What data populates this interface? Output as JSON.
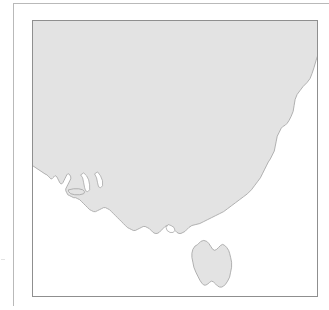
{
  "figure": {
    "type": "map",
    "title": "",
    "caption": "",
    "region_depicted": "south-eastern Australia",
    "projection_note": "",
    "panel": {
      "border_color": "#8f8f8f",
      "background_color": "#ffffff"
    },
    "frame": {
      "rule_color": "#b9b9b9",
      "tick_color": "#e2e2e2"
    }
  },
  "map": {
    "land_fill_color": "#e3e3e3",
    "land_stroke_color": "#a8a8a8",
    "sea_fill_color": "#ffffff",
    "features": [
      {
        "name": "australian-mainland",
        "label": "",
        "fill": "#e3e3e3",
        "path": "M -4 -4 L 292 -4 L 292 22 L 288 31 L 285 40 L 283 47 L 281 53 L 279 58 L 276 62 L 272 66 L 269 70 L 266 74 L 264 79 L 263 85 L 262 91 L 260 96 L 258 100 L 256 103 L 254 105 L 252 106 L 250 108 L 248 112 L 246 116 L 245 121 L 244 126 L 243 131 L 241 135 L 239 139 L 237 142 L 235 146 L 233 150 L 231 154 L 229 158 L 226 162 L 223 166 L 220 170 L 216 174 L 212 177 L 208 180 L 204 183 L 200 186 L 196 189 L 192 192 L 188 194 L 184 196 L 180 198 L 176 200 L 172 202 L 168 204 L 164 205 L 160 206 L 157 208 L 155 210 L 153 212 L 151 213 L 149 214 L 147 214 L 145 213 L 143 211 L 141 209 L 139 207 L 137 206 L 135 206 L 133 207 L 131 209 L 129 211 L 127 213 L 125 214 L 123 214 L 121 213 L 119 211 L 117 209 L 115 208 L 113 207 L 111 207 L 109 208 L 107 209 L 105 210 L 103 211 L 101 211 L 99 210 L 97 209 L 95 208 L 93 206 L 91 204 L 89 202 L 87 200 L 85 198 L 83 196 L 81 194 L 79 192 L 77 190 L 75 189 L 73 188 L 71 188 L 69 189 L 67 190 L 65 191 L 63 192 L 61 192 L 59 191 L 57 190 L 55 188 L 53 186 L 51 184 L 49 182 L 47 180 L 45 179 L 43 178 L 41 178 L 39 177 L 37 176 L 35 175 L 34 173 L 33 171 L 33 169 L 34 167 L 35 165 L 36 163 L 37 161 L 38 159 L 38 157 L 37 155 L 36 154 L 35 154 L 34 155 L 33 157 L 32 159 L 31 161 L 30 163 L 29 164 L 28 164 L 27 163 L 26 161 L 25 159 L 24 157 L 23 156 L 22 156 L 21 157 L 20 158 L 19 159 L 18 159 L 17 158 L 16 157 L 15 156 L 14 155 L 12 154 L 9 152 L 6 150 L 3 148 L 0 146 L -3 144 L -6 142 L -9 140 L -12 138 L -4 138 Z",
        "path_simple": "M -4 -4 L 292 -4 L 292 22 C 285 40 276 62 266 74 C 262 88 258 100 252 106 C 246 116 244 126 241 135 C 235 146 229 158 220 170 C 210 180 200 186 188 194 C 176 200 164 205 155 210 C 149 214 143 211 137 206 C 131 209 125 214 119 211 C 113 207 107 209 101 211 C 95 208 89 202 83 196 C 77 190 71 188 65 191 C 59 191 53 186 47 180 C 41 178 35 175 33 171 C 34 165 38 159 37 155 C 34 155 31 161 28 164 C 25 159 22 156 19 159 C 16 157 13 155 9 152 C 3 148 -6 142 -12 138 L -4 138 Z"
      },
      {
        "name": "tasmania",
        "label": "",
        "fill": "#e3e3e3",
        "path": "M 166 225 L 169 222 L 172 221 L 175 222 L 177 224 L 179 227 L 181 230 L 183 231 L 185 230 L 187 228 L 189 226 L 191 225 L 193 226 L 195 228 L 197 231 L 198 234 L 199 238 L 200 243 L 200 248 L 199 253 L 198 258 L 196 262 L 194 265 L 192 267 L 190 268 L 188 268 L 186 267 L 184 265 L 182 263 L 180 262 L 178 263 L 176 265 L 174 266 L 172 266 L 170 264 L 168 261 L 166 257 L 164 253 L 162 248 L 161 243 L 160 238 L 160 234 L 161 230 L 163 227 Z"
      },
      {
        "name": "kangaroo-island",
        "label": "",
        "fill": "#e3e3e3",
        "path": "M 36 170 L 41 169 L 46 169 L 50 170 L 52 172 L 51 174 L 47 175 L 42 175 L 38 174 L 36 172 Z"
      }
    ],
    "gulfs": [
      {
        "name": "spencer-gulf",
        "path": "M 48 155 L 50 158 L 51 163 L 52 168 L 53 171 L 55 172 L 57 170 L 57 165 L 56 160 L 54 156 L 51 153 Z"
      },
      {
        "name": "gulf-st-vincent",
        "path": "M 62 154 L 64 158 L 65 163 L 66 167 L 68 168 L 70 166 L 70 161 L 68 156 L 65 152 Z"
      },
      {
        "name": "port-phillip-bay",
        "path": "M 136 205 L 139 206 L 142 208 L 143 211 L 141 213 L 138 213 L 135 211 L 134 208 Z"
      }
    ]
  }
}
